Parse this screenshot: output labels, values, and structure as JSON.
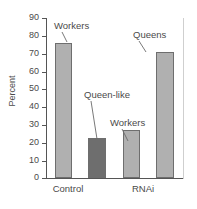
{
  "chart_data": {
    "type": "bar",
    "title": "",
    "subtitle": "",
    "xlabel": "",
    "ylabel": "Percent",
    "categories": [
      "Control",
      "RNAi"
    ],
    "ylim": [
      0,
      90
    ],
    "yticks": [
      0,
      10,
      20,
      30,
      40,
      50,
      60,
      70,
      80,
      90
    ],
    "ytick_labels": [
      "0",
      "10",
      "20",
      "30",
      "40",
      "50",
      "60",
      "70",
      "80",
      "90"
    ],
    "grid": false,
    "legend": "none",
    "bars": [
      {
        "group": "Control",
        "label": "Workers",
        "value": 76,
        "color": "#b0b0b0"
      },
      {
        "group": "Control",
        "label": "Queen-like",
        "value": 22.5,
        "color": "#6e6e6e"
      },
      {
        "group": "RNAi",
        "label": "Workers",
        "value": 27,
        "color": "#b0b0b0"
      },
      {
        "group": "RNAi",
        "label": "Queens",
        "value": 71,
        "color": "#b0b0b0"
      }
    ],
    "annotations": [
      {
        "text": "Workers",
        "target_bar": 0
      },
      {
        "text": "Queen-like",
        "target_bar": 1
      },
      {
        "text": "Workers",
        "target_bar": 2
      },
      {
        "text": "Queens",
        "target_bar": 3
      }
    ],
    "colors": {
      "light_bar": "#b0b0b0",
      "dark_bar": "#6e6e6e",
      "bar_outline": "#6e6e6e",
      "axis": "#555555",
      "text": "#4a4a4a",
      "background": "#ffffff"
    }
  },
  "axis": {
    "ylabel": "Percent",
    "ytick_labels": [
      "90",
      "80",
      "70",
      "60",
      "50",
      "40",
      "30",
      "20",
      "10",
      "0"
    ],
    "xtick_labels": [
      "Control",
      "RNAi"
    ]
  },
  "annotations": {
    "control_workers": "Workers",
    "control_queen_like": "Queen-like",
    "rnai_workers": "Workers",
    "rnai_queens": "Queens"
  }
}
